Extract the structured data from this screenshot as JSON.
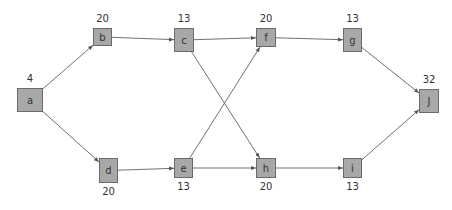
{
  "diagram": {
    "type": "activity-network",
    "colors": {
      "node_fill": "#a8a8a8",
      "node_border": "#6a6a6a",
      "edge": "#707070",
      "text": "#333333"
    },
    "nodes": [
      {
        "id": "a",
        "label": "a",
        "value": "4",
        "x": 17,
        "y": 88,
        "w": 26,
        "h": 24,
        "value_pos": "above"
      },
      {
        "id": "b",
        "label": "b",
        "value": "20",
        "x": 93,
        "y": 28,
        "w": 19,
        "h": 18,
        "value_pos": "above"
      },
      {
        "id": "c",
        "label": "c",
        "value": "13",
        "x": 174,
        "y": 28,
        "w": 20,
        "h": 24,
        "value_pos": "above"
      },
      {
        "id": "d",
        "label": "d",
        "value": "20",
        "x": 99,
        "y": 158,
        "w": 19,
        "h": 25,
        "value_pos": "below"
      },
      {
        "id": "e",
        "label": "e",
        "value": "13",
        "x": 174,
        "y": 158,
        "w": 19,
        "h": 20,
        "value_pos": "below"
      },
      {
        "id": "f",
        "label": "f",
        "value": "20",
        "x": 256,
        "y": 28,
        "w": 20,
        "h": 19,
        "value_pos": "above"
      },
      {
        "id": "g",
        "label": "g",
        "value": "13",
        "x": 343,
        "y": 28,
        "w": 19,
        "h": 24,
        "value_pos": "above"
      },
      {
        "id": "h",
        "label": "h",
        "value": "20",
        "x": 256,
        "y": 158,
        "w": 20,
        "h": 20,
        "value_pos": "below"
      },
      {
        "id": "i",
        "label": "i",
        "value": "13",
        "x": 343,
        "y": 158,
        "w": 19,
        "h": 20,
        "value_pos": "below"
      },
      {
        "id": "J",
        "label": "J",
        "value": "32",
        "x": 419,
        "y": 89,
        "w": 20,
        "h": 24,
        "value_pos": "above"
      }
    ],
    "edges": [
      {
        "from": "a",
        "to": "b"
      },
      {
        "from": "a",
        "to": "d"
      },
      {
        "from": "b",
        "to": "c"
      },
      {
        "from": "c",
        "to": "f"
      },
      {
        "from": "c",
        "to": "h"
      },
      {
        "from": "d",
        "to": "e"
      },
      {
        "from": "e",
        "to": "f"
      },
      {
        "from": "e",
        "to": "h"
      },
      {
        "from": "f",
        "to": "g"
      },
      {
        "from": "h",
        "to": "i"
      },
      {
        "from": "g",
        "to": "J"
      },
      {
        "from": "i",
        "to": "J"
      }
    ]
  }
}
